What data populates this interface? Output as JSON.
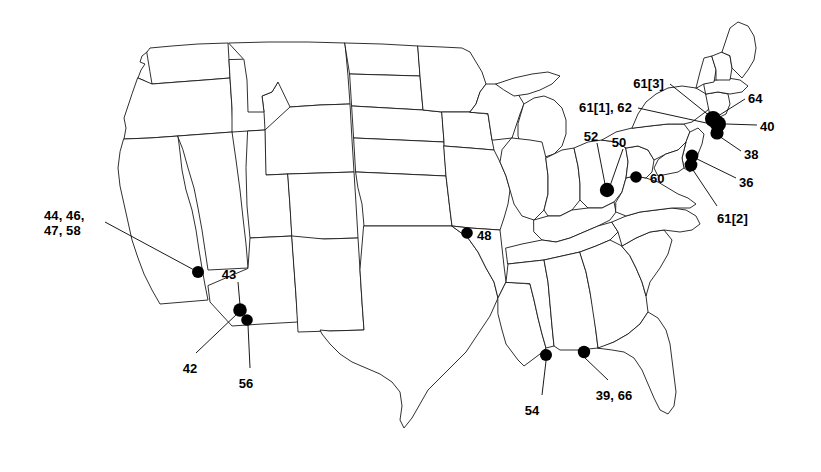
{
  "figure": {
    "type": "map",
    "region": "Contiguous United States",
    "background_color": "#ffffff",
    "outline_color": "#1a1a1a",
    "marker_color": "#000000",
    "marker_shape": "filled-circle",
    "leader_line_color": "#000000"
  },
  "labels": [
    {
      "id": "l_44_46_47_58",
      "text": "44, 46,\n47, 58",
      "align": "left",
      "x": 44,
      "y": 208
    },
    {
      "id": "l_43",
      "text": "43",
      "align": "center",
      "x": 229,
      "y": 267
    },
    {
      "id": "l_42",
      "text": "42",
      "align": "center",
      "x": 190,
      "y": 361
    },
    {
      "id": "l_56",
      "text": "56",
      "align": "center",
      "x": 246,
      "y": 376
    },
    {
      "id": "l_48",
      "text": "48",
      "align": "left",
      "x": 477,
      "y": 228
    },
    {
      "id": "l_54",
      "text": "54",
      "align": "center",
      "x": 532,
      "y": 403
    },
    {
      "id": "l_39_66",
      "text": "39, 66",
      "align": "center",
      "x": 614,
      "y": 388
    },
    {
      "id": "l_52",
      "text": "52",
      "align": "center",
      "x": 591,
      "y": 129
    },
    {
      "id": "l_50",
      "text": "50",
      "align": "center",
      "x": 619,
      "y": 135
    },
    {
      "id": "l_60",
      "text": "60",
      "align": "left",
      "x": 650,
      "y": 171
    },
    {
      "id": "l_61_1_62",
      "text": "61[1], 62",
      "align": "right",
      "x": 632,
      "y": 100
    },
    {
      "id": "l_61_3",
      "text": "61[3]",
      "align": "right",
      "x": 664,
      "y": 76
    },
    {
      "id": "l_64",
      "text": "64",
      "align": "left",
      "x": 748,
      "y": 91
    },
    {
      "id": "l_40",
      "text": "40",
      "align": "left",
      "x": 760,
      "y": 119
    },
    {
      "id": "l_38",
      "text": "38",
      "align": "left",
      "x": 744,
      "y": 147
    },
    {
      "id": "l_36",
      "text": "36",
      "align": "left",
      "x": 739,
      "y": 175
    },
    {
      "id": "l_61_2",
      "text": "61[2]",
      "align": "left",
      "x": 717,
      "y": 211
    }
  ],
  "sites": [
    {
      "id": "s_nv_ca",
      "labels": [
        "44",
        "46",
        "47",
        "58"
      ],
      "x": 198,
      "y": 272,
      "r": 6.0
    },
    {
      "id": "s_az_1",
      "labels": [
        "43",
        "42"
      ],
      "x": 240,
      "y": 310,
      "r": 6.8
    },
    {
      "id": "s_az_2",
      "labels": [
        "56"
      ],
      "x": 247,
      "y": 320,
      "r": 5.8
    },
    {
      "id": "s_mo",
      "labels": [
        "48"
      ],
      "x": 467,
      "y": 233,
      "r": 5.8
    },
    {
      "id": "s_oh",
      "labels": [
        "52",
        "50"
      ],
      "x": 607,
      "y": 190,
      "r": 7.2
    },
    {
      "id": "s_md",
      "labels": [
        "60"
      ],
      "x": 636,
      "y": 177,
      "r": 5.8
    },
    {
      "id": "s_ne_1",
      "labels": [
        "61[3]",
        "64"
      ],
      "x": 713,
      "y": 119,
      "r": 8.0
    },
    {
      "id": "s_ne_2",
      "labels": [
        "61[1]",
        "62",
        "40"
      ],
      "x": 718,
      "y": 124,
      "r": 8.0
    },
    {
      "id": "s_ne_3",
      "labels": [
        "38"
      ],
      "x": 717,
      "y": 133,
      "r": 6.6
    },
    {
      "id": "s_nj_1",
      "labels": [
        "36"
      ],
      "x": 692,
      "y": 156,
      "r": 6.4
    },
    {
      "id": "s_nj_2",
      "labels": [
        "61[2]"
      ],
      "x": 691,
      "y": 165,
      "r": 6.4
    },
    {
      "id": "s_ms",
      "labels": [
        "54"
      ],
      "x": 546,
      "y": 355,
      "r": 6.0
    },
    {
      "id": "s_al_fl",
      "labels": [
        "39",
        "66"
      ],
      "x": 584,
      "y": 352,
      "r": 6.2
    }
  ],
  "leaders": [
    {
      "id": "ld_44",
      "from_label": "l_44_46_47_58",
      "x1": 105,
      "y1": 222,
      "x2": 196,
      "y2": 271
    },
    {
      "id": "ld_43",
      "from_label": "l_43",
      "x1": 238,
      "y1": 282,
      "x2": 240,
      "y2": 305
    },
    {
      "id": "ld_42",
      "from_label": "l_42",
      "x1": 196,
      "y1": 353,
      "x2": 238,
      "y2": 313
    },
    {
      "id": "ld_56",
      "from_label": "l_56",
      "x1": 250,
      "y1": 368,
      "x2": 248,
      "y2": 325
    },
    {
      "id": "ld_54",
      "from_label": "l_54",
      "x1": 542,
      "y1": 395,
      "x2": 546,
      "y2": 361
    },
    {
      "id": "ld_39_66",
      "from_label": "l_39_66",
      "x1": 608,
      "y1": 380,
      "x2": 585,
      "y2": 358
    },
    {
      "id": "ld_52",
      "from_label": "l_52",
      "x1": 597,
      "y1": 143,
      "x2": 605,
      "y2": 184
    },
    {
      "id": "ld_50",
      "from_label": "l_50",
      "x1": 623,
      "y1": 149,
      "x2": 610,
      "y2": 186
    },
    {
      "id": "ld_61_1",
      "from_label": "l_61_1_62",
      "x1": 638,
      "y1": 108,
      "x2": 711,
      "y2": 124
    },
    {
      "id": "ld_61_3",
      "from_label": "l_61_3",
      "x1": 670,
      "y1": 84,
      "x2": 711,
      "y2": 117
    },
    {
      "id": "ld_64",
      "from_label": "l_64",
      "x1": 745,
      "y1": 99,
      "x2": 718,
      "y2": 116
    },
    {
      "id": "ld_40",
      "from_label": "l_40",
      "x1": 757,
      "y1": 125,
      "x2": 726,
      "y2": 124
    },
    {
      "id": "ld_38",
      "from_label": "l_38",
      "x1": 741,
      "y1": 151,
      "x2": 719,
      "y2": 136
    },
    {
      "id": "ld_36",
      "from_label": "l_36",
      "x1": 736,
      "y1": 178,
      "x2": 695,
      "y2": 158
    },
    {
      "id": "ld_61_2",
      "from_label": "l_61_2",
      "x1": 717,
      "y1": 206,
      "x2": 693,
      "y2": 170
    }
  ]
}
